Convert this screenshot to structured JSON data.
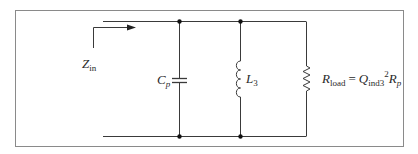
{
  "diagram": {
    "type": "circuit-schematic",
    "colors": {
      "wire": "#3a3a3a",
      "frame": "#8a8a8a",
      "node": "#111111",
      "text": "#2a2a2a"
    },
    "input": {
      "label_main": "Z",
      "label_sub": "in"
    },
    "components": [
      {
        "id": "capacitor",
        "label_main": "C",
        "label_sub": "p"
      },
      {
        "id": "inductor",
        "label_main": "L",
        "label_sub": "3"
      },
      {
        "id": "resistor",
        "label_main": "R",
        "label_sub": "load",
        "eq": "=",
        "rhs_Q": "Q",
        "rhs_Q_sub": "ind3",
        "rhs_exp": "2",
        "rhs_R": "R",
        "rhs_R_sub": "p"
      }
    ]
  }
}
